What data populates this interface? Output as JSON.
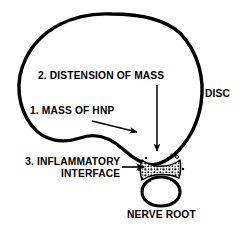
{
  "figure": {
    "stroke_color": "#000000",
    "background_color": "#ffffff"
  },
  "labels": {
    "distension": "2. DISTENSION OF MASS",
    "mass_hnp": "1. MASS OF HNP",
    "inflammatory_line1": "3. INFLAMMATORY",
    "inflammatory_line2": "INTERFACE",
    "disc": "DISC",
    "nerve_root": "NERVE ROOT"
  },
  "annotations": {
    "arrow_diagonal_name": "arrow from mass of hnp label to disc wall",
    "arrow_vertical_name": "arrow from distension label down to interface",
    "arrow_horizontal_name": "arrow from inflammatory interface label to interface"
  },
  "shapes": {
    "disc_outline": "large teardrop disc body narrowing to a neck",
    "inflammatory_interface": "stippled bowtie band at the disc neck",
    "nerve_root": "rounded oval below the interface"
  }
}
